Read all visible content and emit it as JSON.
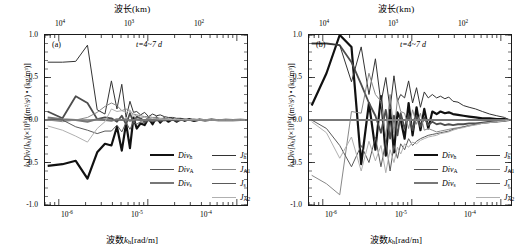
{
  "figure": {
    "panels": [
      {
        "tag": "(a)",
        "annotation": "t=4~7 d",
        "top_axis_title": "波长(km)",
        "bottom_axis_title_prefix": "波数",
        "bottom_axis_title_var": "k",
        "bottom_axis_title_sub": "h",
        "bottom_axis_title_suffix": "[rad/m]",
        "ylabel_parts": {
          "var1": "k",
          "sub1": "h",
          "name": "Div",
          "var2": "[k",
          "sub2": "h",
          "close": "]",
          "scale": "(×10",
          "scale_exp": "6",
          "scale_close": ")",
          "units": "[(m²/s²) • (kg/m³)]"
        },
        "xticks": [
          "10⁴",
          "10³",
          "10²"
        ],
        "xticks_bottom": [
          "10⁻⁶",
          "10⁻⁵",
          "10⁻⁴"
        ],
        "yticks": [
          "1.0",
          "0.5",
          "0.0",
          "-0.5",
          "-1.0"
        ]
      },
      {
        "tag": "(b)",
        "annotation": "t=4~7 d",
        "top_axis_title": "波长(km)",
        "bottom_axis_title_prefix": "波数",
        "bottom_axis_title_var": "k",
        "bottom_axis_title_sub": "h",
        "bottom_axis_title_suffix": "[rad/m]",
        "xticks": [
          "10⁴",
          "10³",
          "10²"
        ],
        "xticks_bottom": [
          "10⁻⁶",
          "10⁻⁵",
          "10⁻⁴"
        ],
        "yticks": [
          "1.0",
          "0.5",
          "0.0",
          "-0.5",
          "-1.0"
        ]
      }
    ],
    "legend": {
      "left_column": [
        {
          "label": "Div",
          "sub": "h",
          "color": "#111111",
          "width": 2.2
        },
        {
          "label": "Div",
          "sub": "A",
          "color": "#4d4d4d",
          "width": 1.8
        },
        {
          "label": "Div",
          "sub": "s",
          "color": "#777777",
          "width": 2.0
        }
      ],
      "right_column": [
        {
          "label": "J",
          "sub": "h",
          "color": "#333333",
          "width": 1.0
        },
        {
          "label": "J",
          "sub": "A1",
          "color": "#888888",
          "width": 1.0
        },
        {
          "label": "J",
          "sub": "s",
          "color": "#5a5a5a",
          "width": 1.0
        },
        {
          "label": "J",
          "sub": "A2",
          "color": "#b0b0b0",
          "width": 1.0
        }
      ]
    }
  },
  "chart_data": [
    {
      "type": "line",
      "panel": "(a)",
      "title": "",
      "xlabel": "波数k_h [rad/m]",
      "ylabel": "k_h Div[k_h] (×10^6) [(m²/s²) • (kg/m³)]",
      "top_xlabel": "波长(km)",
      "xscale": "log",
      "xlim": [
        7e-07,
        0.00013
      ],
      "ylim": [
        -1.0,
        1.0
      ],
      "xticks": [
        1e-06,
        1e-05,
        0.0001
      ],
      "xticklabels": [
        "10^-6",
        "10^-5",
        "10^-4"
      ],
      "top_xticks": [
        10000.0,
        1000.0,
        100.0
      ],
      "top_xticklabels": [
        "10^4",
        "10^3",
        "10^2"
      ],
      "yticks": [
        -1.0,
        -0.5,
        0.0,
        0.5,
        1.0
      ],
      "grid": false,
      "annotation": "t=4~7 d",
      "legend_position": "lower-right",
      "x": [
        7.5e-07,
        1.1e-06,
        1.55e-06,
        2.1e-06,
        2.7e-06,
        3.3e-06,
        3.9e-06,
        4.5e-06,
        5.1e-06,
        5.7e-06,
        6.3e-06,
        6.9e-06,
        7.5e-06,
        8.3e-06,
        9.2e-06,
        1.02e-05,
        1.13e-05,
        1.25e-05,
        1.38e-05,
        1.53e-05,
        1.7e-05,
        1.9e-05,
        2.1e-05,
        2.35e-05,
        2.6e-05,
        2.9e-05,
        3.3e-05,
        3.8e-05,
        4.4e-05,
        5.2e-05,
        6.2e-05,
        7.5e-05,
        9e-05,
        0.00011,
        0.000125
      ],
      "series": [
        {
          "name": "Div_h",
          "color": "#111111",
          "width": 2.2,
          "values": [
            -0.54,
            -0.52,
            -0.48,
            -0.69,
            -0.38,
            -0.28,
            -0.3,
            -0.08,
            -0.36,
            -0.04,
            -0.33,
            0.03,
            -0.1,
            -0.04,
            -0.06,
            0.02,
            -0.05,
            0.03,
            -0.03,
            0.02,
            -0.02,
            0.01,
            -0.02,
            0.01,
            -0.01,
            0.01,
            -0.01,
            0.005,
            -0.005,
            0.004,
            -0.003,
            0.002,
            -0.002,
            0.001,
            0.0
          ]
        },
        {
          "name": "Div_A",
          "color": "#4d4d4d",
          "width": 1.8,
          "values": [
            0.1,
            0.02,
            0.28,
            0.2,
            0.01,
            0.03,
            0.02,
            -0.02,
            0.05,
            -0.05,
            0.08,
            -0.03,
            0.04,
            0.02,
            -0.02,
            0.03,
            -0.01,
            0.02,
            -0.01,
            0.01,
            0.0,
            0.01,
            -0.01,
            0.0,
            0.005,
            0.0,
            -0.003,
            0.002,
            0.0,
            0.001,
            0.0,
            0.0,
            0.0,
            0.0,
            0.0
          ]
        },
        {
          "name": "Div_s",
          "color": "#777777",
          "width": 2.0,
          "values": [
            0.03,
            0.01,
            0.0,
            -0.02,
            0.01,
            0.0,
            -0.01,
            0.01,
            0.0,
            0.01,
            -0.01,
            0.0,
            0.01,
            0.0,
            0.0,
            0.0,
            0.0,
            0.0,
            0.0,
            0.0,
            0.0,
            0.0,
            0.0,
            0.0,
            0.0,
            0.0,
            0.0,
            0.0,
            0.0,
            0.0,
            0.0,
            0.0,
            0.0,
            0.0,
            0.0
          ]
        },
        {
          "name": "J_h",
          "color": "#333333",
          "width": 1.0,
          "values": [
            0.68,
            0.68,
            0.69,
            0.88,
            0.12,
            0.07,
            0.46,
            0.13,
            0.42,
            0.03,
            0.22,
            0.09,
            0.1,
            0.06,
            0.09,
            0.04,
            0.07,
            0.05,
            0.06,
            0.04,
            0.03,
            0.03,
            0.02,
            0.02,
            0.01,
            0.01,
            0.01,
            0.005,
            0.005,
            0.003,
            0.002,
            0.002,
            0.001,
            0.001,
            0.0
          ]
        },
        {
          "name": "J_A1",
          "color": "#888888",
          "width": 1.0,
          "values": [
            0.0,
            -0.02,
            0.0,
            0.03,
            0.09,
            0.16,
            0.2,
            0.17,
            0.11,
            0.13,
            0.1,
            0.07,
            0.06,
            0.05,
            0.04,
            0.04,
            0.03,
            0.03,
            0.02,
            0.02,
            0.015,
            0.01,
            0.01,
            0.008,
            0.006,
            0.005,
            0.004,
            0.003,
            0.002,
            0.002,
            0.001,
            0.001,
            0.0,
            0.0,
            0.0
          ]
        },
        {
          "name": "J_s",
          "color": "#5a5a5a",
          "width": 1.0,
          "values": [
            0.01,
            0.0,
            -0.08,
            -0.12,
            -0.16,
            -0.13,
            -0.13,
            -0.06,
            -0.14,
            -0.03,
            -0.11,
            -0.02,
            -0.05,
            -0.02,
            -0.03,
            -0.01,
            -0.02,
            -0.01,
            -0.01,
            -0.01,
            -0.005,
            -0.005,
            -0.004,
            -0.003,
            -0.002,
            -0.002,
            -0.001,
            -0.001,
            -0.001,
            0.0,
            0.0,
            0.0,
            0.0,
            0.0,
            0.0
          ]
        },
        {
          "name": "J_A2",
          "color": "#b0b0b0",
          "width": 1.0,
          "values": [
            -0.07,
            -0.12,
            -0.19,
            -0.26,
            -0.1,
            -0.02,
            0.13,
            0.1,
            0.11,
            0.09,
            0.12,
            0.04,
            0.06,
            0.03,
            0.03,
            0.02,
            0.02,
            0.015,
            0.01,
            0.01,
            0.008,
            0.006,
            0.005,
            0.004,
            0.003,
            0.002,
            0.002,
            0.001,
            0.001,
            0.0,
            0.0,
            0.0,
            0.0,
            0.0,
            0.0
          ]
        }
      ]
    },
    {
      "type": "line",
      "panel": "(b)",
      "title": "",
      "xlabel": "波数k_h [rad/m]",
      "ylabel": "k_h Div[k_h] (×10^6) [(m²/s²) • (kg/m³)]",
      "top_xlabel": "波长(km)",
      "xscale": "log",
      "xlim": [
        7e-07,
        0.00013
      ],
      "ylim": [
        -1.0,
        1.0
      ],
      "xticks": [
        1e-06,
        1e-05,
        0.0001
      ],
      "xticklabels": [
        "10^-6",
        "10^-5",
        "10^-4"
      ],
      "top_xticks": [
        10000.0,
        1000.0,
        100.0
      ],
      "top_xticklabels": [
        "10^4",
        "10^3",
        "10^2"
      ],
      "yticks": [
        -1.0,
        -0.5,
        0.0,
        0.5,
        1.0
      ],
      "grid": false,
      "annotation": "t=4~7 d",
      "legend_position": "lower-right",
      "x": [
        7.5e-07,
        1.1e-06,
        1.55e-06,
        2.1e-06,
        2.7e-06,
        3.3e-06,
        3.9e-06,
        4.5e-06,
        5.1e-06,
        5.7e-06,
        6.3e-06,
        6.9e-06,
        7.5e-06,
        8.3e-06,
        9.2e-06,
        1.02e-05,
        1.13e-05,
        1.25e-05,
        1.38e-05,
        1.53e-05,
        1.7e-05,
        1.9e-05,
        2.1e-05,
        2.35e-05,
        2.6e-05,
        2.9e-05,
        3.3e-05,
        3.8e-05,
        4.4e-05,
        5.2e-05,
        6.2e-05,
        7.5e-05,
        9e-05,
        0.00011,
        0.000125
      ],
      "series": [
        {
          "name": "Div_h",
          "color": "#111111",
          "width": 2.2,
          "values": [
            0.17,
            0.55,
            1.0,
            0.86,
            -0.52,
            0.2,
            -0.35,
            0.28,
            -0.42,
            0.12,
            -0.38,
            0.09,
            0.0,
            -0.22,
            0.2,
            -0.18,
            0.15,
            -0.12,
            0.13,
            -0.1,
            0.1,
            0.07,
            0.1,
            0.08,
            0.09,
            0.07,
            0.06,
            0.05,
            0.04,
            0.03,
            0.02,
            0.02,
            0.01,
            0.01,
            0.0
          ]
        },
        {
          "name": "Div_A",
          "color": "#4d4d4d",
          "width": 1.8,
          "values": [
            0.9,
            0.9,
            0.88,
            0.68,
            0.42,
            0.2,
            0.05,
            -0.15,
            0.12,
            -0.22,
            0.05,
            -0.18,
            0.08,
            -0.1,
            0.06,
            -0.12,
            0.05,
            -0.08,
            0.03,
            -0.06,
            -0.02,
            -0.05,
            -0.04,
            -0.06,
            -0.05,
            -0.06,
            -0.05,
            -0.05,
            -0.04,
            -0.04,
            -0.03,
            -0.02,
            -0.02,
            -0.01,
            0.0
          ]
        },
        {
          "name": "Div_s",
          "color": "#777777",
          "width": 2.0,
          "values": [
            0.0,
            0.0,
            0.0,
            0.0,
            0.0,
            0.0,
            0.0,
            0.0,
            0.0,
            0.0,
            0.0,
            0.0,
            0.0,
            0.0,
            0.0,
            0.0,
            0.0,
            0.0,
            0.0,
            0.0,
            0.0,
            0.0,
            0.0,
            0.0,
            0.0,
            0.0,
            0.0,
            0.0,
            0.0,
            0.0,
            0.0,
            0.0,
            0.0,
            0.0,
            0.0
          ]
        },
        {
          "name": "J_h",
          "color": "#333333",
          "width": 1.0,
          "values": [
            0.9,
            0.9,
            0.88,
            0.45,
            0.86,
            0.3,
            0.72,
            0.2,
            0.5,
            0.13,
            0.52,
            0.22,
            0.3,
            0.26,
            0.46,
            0.2,
            0.38,
            0.15,
            0.33,
            0.26,
            0.3,
            0.26,
            0.28,
            0.25,
            0.27,
            0.22,
            0.21,
            0.17,
            0.15,
            0.13,
            0.1,
            0.07,
            0.05,
            0.03,
            0.0
          ]
        },
        {
          "name": "J_A1",
          "color": "#888888",
          "width": 1.0,
          "values": [
            -0.65,
            -0.75,
            -0.88,
            0.1,
            0.08,
            0.55,
            0.3,
            0.22,
            -0.2,
            0.3,
            -0.15,
            0.25,
            0.1,
            0.08,
            -0.1,
            0.12,
            -0.05,
            0.08,
            -0.12,
            -0.1,
            -0.12,
            -0.14,
            -0.13,
            -0.12,
            -0.11,
            -0.1,
            -0.09,
            -0.08,
            -0.06,
            -0.05,
            -0.04,
            -0.03,
            -0.02,
            -0.01,
            0.0
          ]
        },
        {
          "name": "J_s",
          "color": "#5a5a5a",
          "width": 1.0,
          "values": [
            0.0,
            -0.1,
            -0.3,
            -0.55,
            -0.3,
            -0.5,
            -0.2,
            -0.55,
            -0.25,
            -0.6,
            -0.3,
            -0.45,
            -0.28,
            -0.35,
            -0.22,
            -0.3,
            -0.25,
            -0.22,
            -0.2,
            -0.18,
            -0.17,
            -0.16,
            -0.15,
            -0.14,
            -0.13,
            -0.11,
            -0.1,
            -0.08,
            -0.07,
            -0.05,
            -0.04,
            -0.03,
            -0.02,
            -0.01,
            0.0
          ]
        },
        {
          "name": "J_A2",
          "color": "#b0b0b0",
          "width": 1.0,
          "values": [
            -0.02,
            -0.15,
            -0.45,
            -0.2,
            -0.6,
            -0.25,
            -0.48,
            -0.3,
            -0.62,
            -0.35,
            -0.5,
            -0.32,
            -0.4,
            -0.28,
            -0.32,
            -0.26,
            -0.28,
            -0.24,
            -0.22,
            -0.2,
            -0.19,
            -0.18,
            -0.16,
            -0.15,
            -0.14,
            -0.12,
            -0.1,
            -0.09,
            -0.07,
            -0.06,
            -0.04,
            -0.03,
            -0.02,
            -0.01,
            0.0
          ]
        }
      ]
    }
  ]
}
